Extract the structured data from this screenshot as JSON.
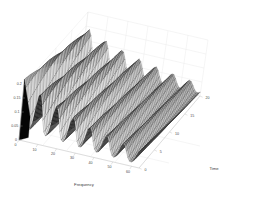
{
  "figure": {
    "title": "",
    "background_color": "#ffffff",
    "plot_type": "3d-mesh-surface"
  },
  "axes": {
    "x": {
      "label": "Frequency",
      "ticks": [
        "0",
        "10",
        "20",
        "30",
        "40",
        "50",
        "60"
      ],
      "min": 0,
      "max": 64
    },
    "y": {
      "label": "Time",
      "ticks": [
        "0",
        "5",
        "10",
        "15",
        "20"
      ],
      "min": 0,
      "max": 22
    },
    "z": {
      "label": "",
      "ticks": [
        "0",
        "0.05",
        "0.1",
        "0.15",
        "0.2"
      ],
      "min": 0,
      "max": 0.2
    }
  },
  "chart_data": {
    "type": "surface",
    "title": "",
    "xlabel": "Frequency",
    "ylabel": "Time",
    "zlabel": "",
    "xlim": [
      0,
      64
    ],
    "ylim": [
      0,
      22
    ],
    "zlim": [
      0,
      0.2
    ],
    "xticks": [
      0,
      10,
      20,
      30,
      40,
      50,
      60
    ],
    "yticks": [
      0,
      5,
      10,
      15,
      20
    ],
    "zticks": [
      0,
      0.05,
      0.1,
      0.15,
      0.2
    ],
    "grid": true,
    "legend": "none",
    "mesh_color": "#1a1a1a",
    "face_color": "#d8d8d8",
    "view_azimuth": -37.5,
    "view_elevation": 30,
    "x": [
      0,
      4,
      8,
      12,
      16,
      20,
      24,
      28,
      32,
      36,
      40,
      44,
      48,
      52,
      56,
      60,
      64
    ],
    "y": [
      0,
      2,
      4,
      6,
      8,
      10,
      12,
      14,
      16,
      18,
      20,
      22
    ],
    "series": [
      {
        "name": "Time=0",
        "values": [
          0.19,
          0.03,
          0.155,
          0.04,
          0.135,
          0.042,
          0.12,
          0.038,
          0.105,
          0.035,
          0.092,
          0.032,
          0.08,
          0.028,
          0.07,
          0.025,
          0.06
        ]
      },
      {
        "name": "Time=2",
        "values": [
          0.18,
          0.034,
          0.15,
          0.044,
          0.13,
          0.046,
          0.116,
          0.041,
          0.102,
          0.037,
          0.089,
          0.034,
          0.078,
          0.03,
          0.068,
          0.026,
          0.058
        ]
      },
      {
        "name": "Time=4",
        "values": [
          0.172,
          0.04,
          0.145,
          0.05,
          0.126,
          0.05,
          0.112,
          0.045,
          0.099,
          0.04,
          0.086,
          0.036,
          0.075,
          0.032,
          0.066,
          0.028,
          0.056
        ]
      },
      {
        "name": "Time=6",
        "values": [
          0.165,
          0.046,
          0.14,
          0.055,
          0.122,
          0.054,
          0.108,
          0.048,
          0.096,
          0.043,
          0.083,
          0.038,
          0.073,
          0.034,
          0.064,
          0.029,
          0.054
        ]
      },
      {
        "name": "Time=8",
        "values": [
          0.158,
          0.05,
          0.135,
          0.058,
          0.118,
          0.057,
          0.105,
          0.051,
          0.093,
          0.045,
          0.081,
          0.04,
          0.071,
          0.035,
          0.062,
          0.03,
          0.052
        ]
      },
      {
        "name": "Time=10",
        "values": [
          0.152,
          0.054,
          0.131,
          0.061,
          0.114,
          0.059,
          0.102,
          0.053,
          0.09,
          0.047,
          0.079,
          0.042,
          0.069,
          0.036,
          0.06,
          0.031,
          0.051
        ]
      },
      {
        "name": "Time=12",
        "values": [
          0.146,
          0.056,
          0.127,
          0.063,
          0.111,
          0.061,
          0.099,
          0.055,
          0.088,
          0.049,
          0.077,
          0.043,
          0.067,
          0.037,
          0.059,
          0.032,
          0.05
        ]
      },
      {
        "name": "Time=14",
        "values": [
          0.141,
          0.058,
          0.123,
          0.064,
          0.108,
          0.062,
          0.096,
          0.056,
          0.086,
          0.05,
          0.075,
          0.044,
          0.066,
          0.038,
          0.058,
          0.032,
          0.049
        ]
      },
      {
        "name": "Time=16",
        "values": [
          0.136,
          0.059,
          0.12,
          0.065,
          0.105,
          0.063,
          0.094,
          0.057,
          0.084,
          0.051,
          0.074,
          0.045,
          0.065,
          0.038,
          0.057,
          0.033,
          0.048
        ]
      },
      {
        "name": "Time=18",
        "values": [
          0.132,
          0.06,
          0.117,
          0.065,
          0.103,
          0.064,
          0.092,
          0.057,
          0.082,
          0.051,
          0.072,
          0.045,
          0.064,
          0.039,
          0.056,
          0.033,
          0.048
        ]
      },
      {
        "name": "Time=20",
        "values": [
          0.128,
          0.06,
          0.114,
          0.066,
          0.101,
          0.064,
          0.09,
          0.058,
          0.081,
          0.052,
          0.071,
          0.046,
          0.063,
          0.039,
          0.055,
          0.033,
          0.047
        ]
      },
      {
        "name": "Time=22",
        "values": [
          0.125,
          0.061,
          0.112,
          0.066,
          0.099,
          0.064,
          0.089,
          0.058,
          0.08,
          0.052,
          0.07,
          0.046,
          0.062,
          0.039,
          0.055,
          0.034,
          0.047
        ]
      }
    ]
  }
}
